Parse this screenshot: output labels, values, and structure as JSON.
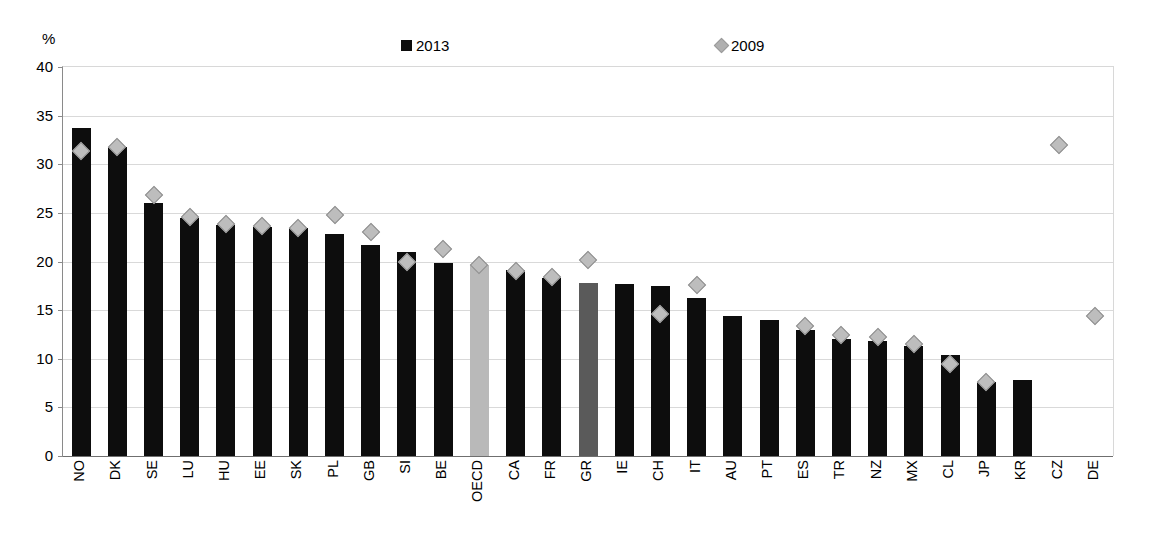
{
  "chart_data": {
    "type": "bar",
    "title": "",
    "subtitle": "",
    "unit_label": "%",
    "xlabel": "",
    "ylabel": "",
    "ylim": [
      0,
      40
    ],
    "ytick_step": 5,
    "yticks": [
      40,
      35,
      30,
      25,
      20,
      15,
      10,
      5,
      0
    ],
    "grid": true,
    "legend_position": "top-center",
    "legend": [
      {
        "name": "2013",
        "marker": "square",
        "color": "#0d0d0d"
      },
      {
        "name": "2009",
        "marker": "diamond",
        "color": "#bdbdbd"
      }
    ],
    "categories": [
      "NO",
      "DK",
      "SE",
      "LU",
      "HU",
      "EE",
      "SK",
      "PL",
      "GB",
      "SI",
      "BE",
      "OECD",
      "CA",
      "FR",
      "GR",
      "IE",
      "CH",
      "IT",
      "AU",
      "PT",
      "ES",
      "TR",
      "NZ",
      "MX",
      "CL",
      "JP",
      "KR",
      "CZ",
      "DE"
    ],
    "series": [
      {
        "name": "2013",
        "marker": "bar",
        "values": [
          33.7,
          31.8,
          26.0,
          24.5,
          23.8,
          23.6,
          23.4,
          22.8,
          21.7,
          21.0,
          19.8,
          19.6,
          19.1,
          18.3,
          17.8,
          17.7,
          17.5,
          16.2,
          14.4,
          14.0,
          13.0,
          12.0,
          11.8,
          11.3,
          10.4,
          7.6,
          7.8,
          null,
          null
        ]
      },
      {
        "name": "2009",
        "marker": "diamond",
        "values": [
          31.4,
          31.8,
          26.8,
          24.6,
          23.9,
          23.7,
          23.4,
          24.8,
          23.0,
          20.0,
          21.3,
          19.6,
          19.0,
          18.4,
          20.2,
          null,
          14.6,
          17.6,
          null,
          null,
          13.4,
          12.4,
          12.2,
          11.5,
          9.5,
          7.6,
          null,
          32.0,
          14.4
        ]
      }
    ],
    "highlighted_categories": {
      "OECD": "#b9b9b9",
      "GR": "#5a5a5a"
    }
  }
}
